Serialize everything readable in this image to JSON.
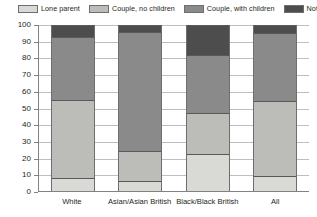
{
  "chart_data": {
    "type": "bar",
    "subtype": "stacked-bar-100",
    "title": "",
    "xlabel": "",
    "ylabel": "",
    "ylim": [
      0,
      100
    ],
    "ytick_step": 10,
    "grid": true,
    "legend_position": "top",
    "categories": [
      "White",
      "Asian/Asian British",
      "Black/Black British",
      "All"
    ],
    "yticks": [
      "100",
      "90",
      "80",
      "70",
      "60",
      "50",
      "40",
      "30",
      "20",
      "10",
      "0"
    ],
    "series": [
      {
        "name": "Lone parent",
        "color": "#d9d9d6",
        "values": [
          8,
          6,
          22,
          9
        ]
      },
      {
        "name": "Couple, no children",
        "color": "#bcbcb8",
        "values": [
          47,
          18,
          25,
          45
        ]
      },
      {
        "name": "Couple, with children",
        "color": "#8a8a8a",
        "values": [
          38,
          72,
          35,
          41
        ]
      },
      {
        "name": "Not in family",
        "color": "#4d4d4d",
        "values": [
          7,
          4,
          18,
          5
        ]
      }
    ]
  },
  "legend": {
    "items": [
      {
        "label": "Lone parent"
      },
      {
        "label": "Couple, no children"
      },
      {
        "label": "Couple, with children"
      },
      {
        "label": "Not in family"
      }
    ]
  }
}
